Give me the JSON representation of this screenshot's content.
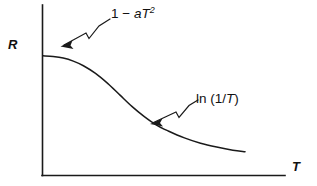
{
  "figure": {
    "background_color": "#ffffff",
    "ink_color": "#1a1a1a"
  },
  "chart_data": {
    "type": "line",
    "title": "",
    "xlabel": "T",
    "ylabel": "R",
    "grid": false,
    "legend": "none",
    "axis_style": "open L-shaped axes, no tick marks, no numeric scale",
    "xlim": [
      0,
      1
    ],
    "ylim": [
      0,
      1
    ],
    "series": [
      {
        "name": "resistance-vs-temperature",
        "description": "Schematic sigmoid decay of resistance R with increasing temperature T: flat plateau at low T, steep drop through an inflection, then a slow logarithmic tail.",
        "x": [
          0.0,
          0.05,
          0.1,
          0.15,
          0.2,
          0.26,
          0.32,
          0.38,
          0.44,
          0.5,
          0.56,
          0.62,
          0.7,
          0.78,
          0.86,
          0.94,
          1.0
        ],
        "y": [
          0.78,
          0.775,
          0.765,
          0.745,
          0.715,
          0.665,
          0.6,
          0.525,
          0.45,
          0.385,
          0.33,
          0.29,
          0.245,
          0.21,
          0.185,
          0.165,
          0.155
        ]
      }
    ],
    "annotations": [
      {
        "id": "low-temperature-regime",
        "text": "1 − aT²",
        "text_parts": {
          "prefix": "1 − ",
          "italic_a": "a",
          "italic_T": "T",
          "superscript": "2"
        },
        "leader": "zigzag-arrow",
        "points_to": "plateau region of the curve near the R axis"
      },
      {
        "id": "high-temperature-regime",
        "text": "ln (1/T)",
        "text_parts": {
          "prefix": "ln (1/",
          "italic_T": "T",
          "suffix": ")"
        },
        "leader": "zigzag-arrow",
        "points_to": "slowly decaying tail of the curve"
      }
    ]
  }
}
